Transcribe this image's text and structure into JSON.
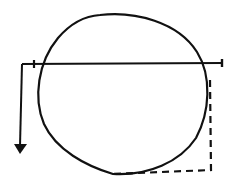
{
  "diagram": {
    "colors": {
      "background": "#ffffff",
      "stroke": "#111111"
    },
    "circle": {
      "cx": 122,
      "cy": 94,
      "rx": 86,
      "ry": 80
    },
    "horizontal_line": {
      "x1": 22,
      "y1": 64,
      "x2": 222,
      "y2": 63,
      "ticks": [
        34,
        222
      ]
    },
    "down_arrow": {
      "x1": 22,
      "y1": 64,
      "x2": 20,
      "y2": 146,
      "head_y": 153
    },
    "dashed_path": {
      "points": [
        [
          210,
          80
        ],
        [
          211,
          170
        ],
        [
          113,
          174
        ]
      ]
    }
  }
}
